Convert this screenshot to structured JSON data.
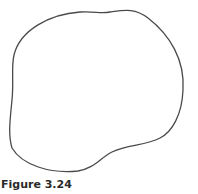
{
  "figure": {
    "caption": "Figure 3.24",
    "shape": {
      "type": "closed-irregular-curve",
      "stroke_color": "#4a4a4a",
      "fill_color": "#ffffff"
    }
  }
}
